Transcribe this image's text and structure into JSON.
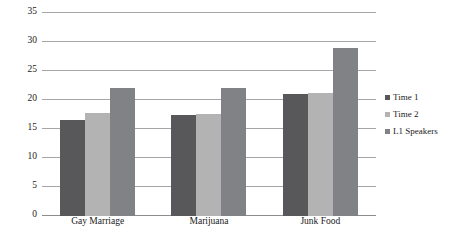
{
  "chart_data": {
    "type": "bar",
    "title": "",
    "subtitle": "",
    "xlabel": "",
    "ylabel": "",
    "categories": [
      "Gay Marriage",
      "Marijuana",
      "Junk Food"
    ],
    "series": [
      {
        "name": "Time 1",
        "color": "#58585a",
        "values": [
          16.5,
          17.5,
          21.0
        ]
      },
      {
        "name": "Time 2",
        "color": "#b3b3b3",
        "values": [
          17.8,
          17.6,
          21.2
        ]
      },
      {
        "name": "L1 Speakers",
        "color": "#808285",
        "values": [
          22.0,
          22.0,
          29.0
        ]
      }
    ],
    "ylim": [
      0,
      35
    ],
    "yticks": [
      0,
      5,
      10,
      15,
      20,
      25,
      30,
      35
    ],
    "ytick_labels": [
      "0",
      "5",
      "10",
      "15",
      "20",
      "25",
      "30",
      "35"
    ],
    "grid": true,
    "grid_color": "#a6a6a6",
    "legend_position": "right",
    "background": "#ffffff"
  }
}
